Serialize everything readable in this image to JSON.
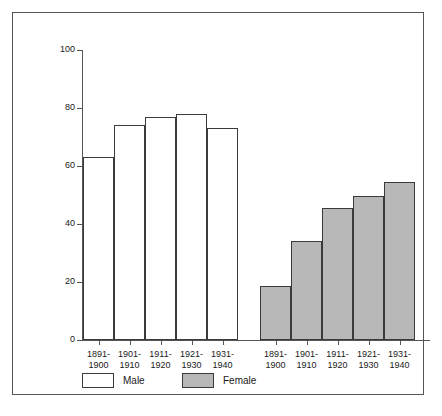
{
  "chart_data": {
    "type": "bar",
    "title": "",
    "subtitle": "",
    "xlabel": "",
    "ylabel": "Percent",
    "ylim": [
      0,
      100
    ],
    "yticks": [
      0,
      20,
      40,
      60,
      80,
      100
    ],
    "ytick_labels": [
      "0",
      "20",
      "40",
      "60",
      "80",
      "100"
    ],
    "grid": false,
    "legend_position": "bottom-left",
    "group_labels": [
      "Male",
      "Female"
    ],
    "categories": [
      "1891-\n1900",
      "1901-\n1910",
      "1911-\n1920",
      "1921-\n1930",
      "1931-\n1940"
    ],
    "category_lines": [
      [
        "1891-",
        "1900"
      ],
      [
        "1901-",
        "1910"
      ],
      [
        "1911-",
        "1920"
      ],
      [
        "1921-",
        "1930"
      ],
      [
        "1931-",
        "1940"
      ]
    ],
    "series": [
      {
        "name": "Male",
        "color": "#ffffff",
        "edge_color": "#3a3a3a",
        "values": [
          63,
          74,
          77,
          78,
          73
        ]
      },
      {
        "name": "Female",
        "color": "#b8b8b8",
        "edge_color": "#3a3a3a",
        "values": [
          18.6,
          34,
          45.5,
          49.5,
          54.5
        ]
      }
    ]
  },
  "axis": {
    "y_label": "Percent",
    "ticks": [
      {
        "value": 100,
        "label": "100"
      },
      {
        "value": 80,
        "label": "80"
      },
      {
        "value": 60,
        "label": "60"
      },
      {
        "value": 40,
        "label": "40"
      },
      {
        "value": 20,
        "label": "20"
      },
      {
        "value": 0,
        "label": "0"
      }
    ]
  },
  "male_bars": [
    {
      "label_top": "1891-",
      "label_bottom": "1900",
      "value": 63
    },
    {
      "label_top": "1901-",
      "label_bottom": "1910",
      "value": 74
    },
    {
      "label_top": "1911-",
      "label_bottom": "1920",
      "value": 77
    },
    {
      "label_top": "1921-",
      "label_bottom": "1930",
      "value": 78
    },
    {
      "label_top": "1931-",
      "label_bottom": "1940",
      "value": 73
    }
  ],
  "female_bars": [
    {
      "label_top": "1891-",
      "label_bottom": "1900",
      "value": 18.6
    },
    {
      "label_top": "1901-",
      "label_bottom": "1910",
      "value": 34
    },
    {
      "label_top": "1911-",
      "label_bottom": "1920",
      "value": 45.5
    },
    {
      "label_top": "1921-",
      "label_bottom": "1930",
      "value": 49.5
    },
    {
      "label_top": "1931-",
      "label_bottom": "1940",
      "value": 54.5
    }
  ],
  "legend": {
    "items": [
      {
        "label": "Male",
        "color": "#ffffff"
      },
      {
        "label": "Female",
        "color": "#b8b8b8"
      }
    ]
  },
  "colors": {
    "male_fill": "#ffffff",
    "female_fill": "#b8b8b8",
    "edge": "#3a3a3a",
    "axis": "#555555",
    "text": "#1a1a1a",
    "background": "#ffffff",
    "frame": "#555555"
  }
}
